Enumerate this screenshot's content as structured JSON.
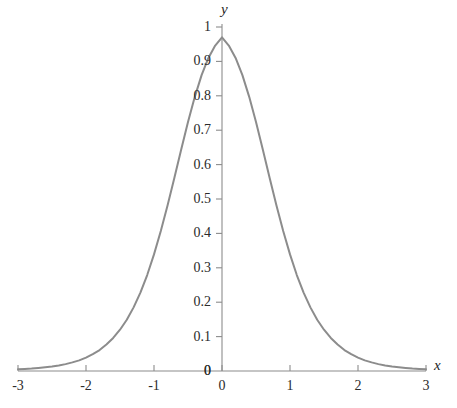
{
  "chart_data": {
    "type": "line",
    "title": "",
    "subtitle": "",
    "xlabel": "x",
    "ylabel": "y",
    "xlim": [
      -3,
      3
    ],
    "ylim": [
      0,
      1
    ],
    "grid": false,
    "legend": null,
    "series": [
      {
        "name": "bell curve",
        "color": "#8c8c8c",
        "line_width": 2,
        "x": [
          -3,
          -2.9,
          -2.8,
          -2.7,
          -2.6,
          -2.5,
          -2.4,
          -2.3,
          -2.2,
          -2.1,
          -2,
          -1.9,
          -1.8,
          -1.7,
          -1.6,
          -1.5,
          -1.4,
          -1.3,
          -1.2,
          -1.1,
          -1,
          -0.9,
          -0.8,
          -0.7,
          -0.6,
          -0.5,
          -0.4,
          -0.3,
          -0.2,
          -0.1,
          0,
          0.1,
          0.2,
          0.3,
          0.4,
          0.5,
          0.6,
          0.7,
          0.8,
          0.9,
          1,
          1.1,
          1.2,
          1.3,
          1.4,
          1.5,
          1.6,
          1.7,
          1.8,
          1.9,
          2,
          2.1,
          2.2,
          2.3,
          2.4,
          2.5,
          2.6,
          2.7,
          2.8,
          2.9,
          3
        ],
        "y": [
          0.005,
          0.006,
          0.007,
          0.009,
          0.011,
          0.013,
          0.016,
          0.02,
          0.025,
          0.031,
          0.039,
          0.049,
          0.061,
          0.077,
          0.096,
          0.12,
          0.149,
          0.185,
          0.228,
          0.279,
          0.339,
          0.407,
          0.482,
          0.562,
          0.644,
          0.724,
          0.797,
          0.86,
          0.91,
          0.946,
          0.97,
          0.946,
          0.91,
          0.86,
          0.797,
          0.724,
          0.644,
          0.562,
          0.482,
          0.407,
          0.339,
          0.279,
          0.228,
          0.185,
          0.149,
          0.12,
          0.096,
          0.077,
          0.061,
          0.049,
          0.039,
          0.031,
          0.025,
          0.02,
          0.016,
          0.013,
          0.011,
          0.009,
          0.007,
          0.006,
          0.005
        ]
      }
    ],
    "x_ticks": [
      -3,
      -2,
      -1,
      0,
      1,
      2,
      3
    ],
    "x_tick_labels": [
      "-3",
      "-2",
      "-1",
      "0",
      "1",
      "2",
      "3"
    ],
    "y_ticks": [
      0,
      0.1,
      0.2,
      0.3,
      0.4,
      0.5,
      0.6,
      0.7,
      0.8,
      0.9,
      1
    ],
    "y_tick_labels": [
      "0",
      "0.1",
      "0.2",
      "0.3",
      "0.4",
      "0.5",
      "0.6",
      "0.7",
      "0.8",
      "0.9",
      "1"
    ],
    "annotations": [],
    "axis_color": "#8c8c8c",
    "background_color": "#ffffff"
  },
  "axes": {
    "x_axis_label": "x",
    "y_axis_label": "y",
    "y_axis_origin_label": "0"
  }
}
